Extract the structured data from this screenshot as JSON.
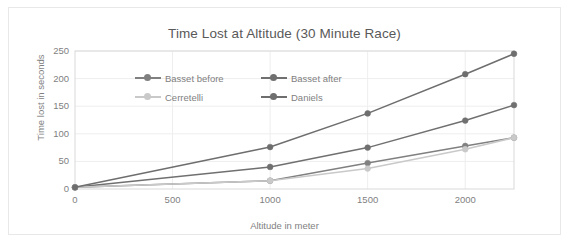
{
  "chart_data": {
    "type": "line",
    "title": "Time Lost at Altitude (30 Minute Race)",
    "xlabel": "Altitude in meter",
    "ylabel": "Time lost in seconds",
    "xlim": [
      0,
      2250
    ],
    "ylim": [
      0,
      250
    ],
    "xticks": [
      0,
      500,
      1000,
      1500,
      2000
    ],
    "xtick_labels": [
      "0",
      "500",
      "1000",
      "1500",
      "2000"
    ],
    "yticks": [
      0,
      50,
      100,
      150,
      200,
      250
    ],
    "ytick_labels": [
      "0",
      "50",
      "100",
      "150",
      "200",
      "250"
    ],
    "grid": true,
    "grid_axis": "both",
    "legend_position": "upper-left-inside",
    "x": [
      0,
      1000,
      1500,
      2000,
      2250
    ],
    "series": [
      {
        "name": "Basset before",
        "color": "#808080",
        "marker": "circle",
        "values": [
          3,
          15,
          47,
          78,
          93
        ]
      },
      {
        "name": "Basset after",
        "color": "#707070",
        "marker": "circle",
        "values": [
          3,
          40,
          75,
          124,
          152
        ]
      },
      {
        "name": "Cerretelli",
        "color": "#c9c9c9",
        "marker": "circle",
        "values": [
          3,
          15,
          37,
          72,
          93
        ]
      },
      {
        "name": "Daniels",
        "color": "#6e6e6e",
        "marker": "circle",
        "values": [
          3,
          76,
          137,
          208,
          245
        ]
      }
    ]
  },
  "style": {
    "plot_border_color": "#d9d9d9",
    "grid_color": "#eeeeee",
    "frame_border_color": "#e8e8e8",
    "text_color": "#7f7f7f",
    "title_color": "#595959",
    "background": "#ffffff"
  }
}
